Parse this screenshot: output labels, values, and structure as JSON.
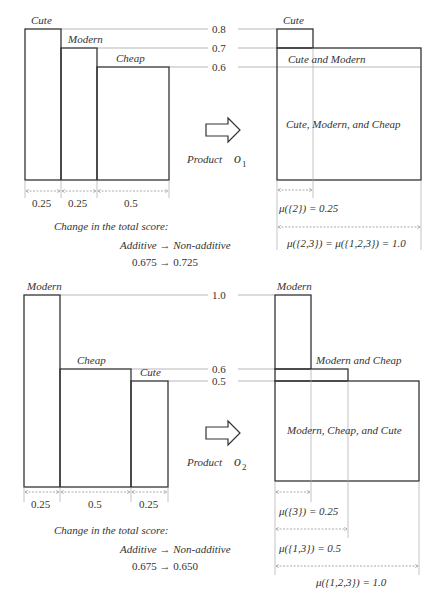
{
  "panel1": {
    "bars": [
      {
        "label": "Cute",
        "width": 0.25,
        "height": 0.8
      },
      {
        "label": "Modern",
        "width": 0.25,
        "height": 0.7
      },
      {
        "label": "Cheap",
        "width": 0.5,
        "height": 0.6
      }
    ],
    "levels": [
      "0.8",
      "0.7",
      "0.6"
    ],
    "widths": [
      "0.25",
      "0.25",
      "0.5"
    ],
    "product_label": "Product",
    "product_symbol": "o",
    "product_sub": "1",
    "change_title": "Change in the total score:",
    "change_line1": "Additive → Non-additive",
    "change_line2": "0.675 → 0.725",
    "result_regions": [
      "Cute",
      "Cute and Modern",
      "Cute, Modern, and Cheap"
    ],
    "mu_labels": [
      "μ({2}) = 0.25",
      "μ({2,3}) = μ({1,2,3}) = 1.0"
    ]
  },
  "panel2": {
    "bars": [
      {
        "label": "Modern",
        "width": 0.25,
        "height": 1.0
      },
      {
        "label": "Cheap",
        "width": 0.5,
        "height": 0.6
      },
      {
        "label": "Cute",
        "width": 0.25,
        "height": 0.5
      }
    ],
    "levels": [
      "1.0",
      "0.6",
      "0.5"
    ],
    "widths": [
      "0.25",
      "0.5",
      "0.25"
    ],
    "product_label": "Product",
    "product_symbol": "o",
    "product_sub": "2",
    "change_title": "Change in the total score:",
    "change_line1": "Additive → Non-additive",
    "change_line2": "0.675 → 0.650",
    "result_regions": [
      "Modern",
      "Modern and Cheap",
      "Modern, Cheap, and Cute"
    ],
    "mu_labels": [
      "μ({3}) = 0.25",
      "μ({1,3}) = 0.5",
      "μ({1,2,3}) = 1.0"
    ]
  }
}
